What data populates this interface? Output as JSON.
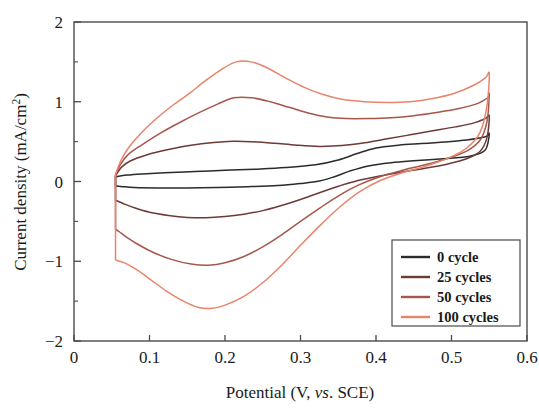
{
  "chart_data": {
    "type": "line",
    "title": "",
    "subtitle": "",
    "xlabel": "Potential (V, vs. SCE)",
    "xlabel_parts": {
      "before": "Potential (V, ",
      "italic": "vs",
      "after": ". SCE)"
    },
    "ylabel": "Current density (mA/cm2)",
    "ylabel_parts": {
      "main": "Current density (mA/cm",
      "superscript": "2",
      "tail": ")"
    },
    "xlim": [
      0,
      0.6
    ],
    "ylim": [
      -2,
      2
    ],
    "xticks": [
      0,
      0.1,
      0.2,
      0.3,
      0.4,
      0.5,
      0.6
    ],
    "xtick_labels": [
      "0",
      "0.1",
      "0.2",
      "0.3",
      "0.4",
      "0.5",
      "0.6"
    ],
    "yticks": [
      -2,
      -1,
      0,
      1,
      2
    ],
    "ytick_labels": [
      "-2",
      "-1",
      "0",
      "1",
      "2"
    ],
    "y_minor_ticks": [
      -1.5,
      -0.5,
      0.5,
      1.5
    ],
    "grid": false,
    "legend_position": "lower-right",
    "series": [
      {
        "name": "0 cycle",
        "color": "#2b2b2b",
        "forward": [
          [
            0.055,
            0.06
          ],
          [
            0.07,
            0.08
          ],
          [
            0.09,
            0.095
          ],
          [
            0.12,
            0.11
          ],
          [
            0.16,
            0.125
          ],
          [
            0.2,
            0.14
          ],
          [
            0.24,
            0.155
          ],
          [
            0.28,
            0.175
          ],
          [
            0.32,
            0.21
          ],
          [
            0.35,
            0.27
          ],
          [
            0.375,
            0.35
          ],
          [
            0.4,
            0.42
          ],
          [
            0.43,
            0.455
          ],
          [
            0.46,
            0.475
          ],
          [
            0.49,
            0.495
          ],
          [
            0.52,
            0.52
          ],
          [
            0.545,
            0.56
          ],
          [
            0.55,
            0.6
          ]
        ],
        "reverse": [
          [
            0.55,
            0.6
          ],
          [
            0.545,
            0.4
          ],
          [
            0.53,
            0.33
          ],
          [
            0.51,
            0.3
          ],
          [
            0.48,
            0.28
          ],
          [
            0.45,
            0.26
          ],
          [
            0.42,
            0.235
          ],
          [
            0.39,
            0.195
          ],
          [
            0.365,
            0.13
          ],
          [
            0.345,
            0.06
          ],
          [
            0.325,
            0.005
          ],
          [
            0.3,
            -0.025
          ],
          [
            0.27,
            -0.05
          ],
          [
            0.23,
            -0.065
          ],
          [
            0.19,
            -0.075
          ],
          [
            0.15,
            -0.08
          ],
          [
            0.11,
            -0.08
          ],
          [
            0.08,
            -0.075
          ],
          [
            0.065,
            -0.065
          ],
          [
            0.055,
            -0.055
          ]
        ]
      },
      {
        "name": "25 cycles",
        "color": "#6d3a36",
        "forward": [
          [
            0.055,
            0.07
          ],
          [
            0.063,
            0.18
          ],
          [
            0.075,
            0.26
          ],
          [
            0.095,
            0.33
          ],
          [
            0.125,
            0.4
          ],
          [
            0.155,
            0.455
          ],
          [
            0.185,
            0.49
          ],
          [
            0.21,
            0.505
          ],
          [
            0.235,
            0.5
          ],
          [
            0.265,
            0.48
          ],
          [
            0.295,
            0.455
          ],
          [
            0.325,
            0.44
          ],
          [
            0.355,
            0.45
          ],
          [
            0.385,
            0.485
          ],
          [
            0.415,
            0.535
          ],
          [
            0.445,
            0.585
          ],
          [
            0.475,
            0.635
          ],
          [
            0.505,
            0.685
          ],
          [
            0.53,
            0.735
          ],
          [
            0.545,
            0.79
          ],
          [
            0.55,
            0.82
          ]
        ],
        "reverse": [
          [
            0.55,
            0.82
          ],
          [
            0.547,
            0.55
          ],
          [
            0.538,
            0.38
          ],
          [
            0.52,
            0.285
          ],
          [
            0.495,
            0.22
          ],
          [
            0.465,
            0.165
          ],
          [
            0.435,
            0.12
          ],
          [
            0.405,
            0.07
          ],
          [
            0.375,
            0.01
          ],
          [
            0.35,
            -0.06
          ],
          [
            0.325,
            -0.14
          ],
          [
            0.3,
            -0.225
          ],
          [
            0.275,
            -0.3
          ],
          [
            0.25,
            -0.365
          ],
          [
            0.225,
            -0.41
          ],
          [
            0.2,
            -0.44
          ],
          [
            0.175,
            -0.455
          ],
          [
            0.15,
            -0.45
          ],
          [
            0.125,
            -0.425
          ],
          [
            0.1,
            -0.385
          ],
          [
            0.08,
            -0.33
          ],
          [
            0.065,
            -0.275
          ],
          [
            0.055,
            -0.235
          ]
        ]
      },
      {
        "name": "50 cycles",
        "color": "#a6564a",
        "forward": [
          [
            0.055,
            0.08
          ],
          [
            0.062,
            0.22
          ],
          [
            0.072,
            0.34
          ],
          [
            0.09,
            0.46
          ],
          [
            0.115,
            0.61
          ],
          [
            0.14,
            0.74
          ],
          [
            0.165,
            0.86
          ],
          [
            0.19,
            0.97
          ],
          [
            0.212,
            1.05
          ],
          [
            0.235,
            1.05
          ],
          [
            0.26,
            1.0
          ],
          [
            0.285,
            0.93
          ],
          [
            0.31,
            0.86
          ],
          [
            0.335,
            0.81
          ],
          [
            0.36,
            0.79
          ],
          [
            0.39,
            0.79
          ],
          [
            0.42,
            0.8
          ],
          [
            0.45,
            0.825
          ],
          [
            0.48,
            0.865
          ],
          [
            0.51,
            0.915
          ],
          [
            0.535,
            0.98
          ],
          [
            0.548,
            1.05
          ],
          [
            0.55,
            1.09
          ]
        ],
        "reverse": [
          [
            0.55,
            1.09
          ],
          [
            0.547,
            0.75
          ],
          [
            0.538,
            0.52
          ],
          [
            0.52,
            0.38
          ],
          [
            0.495,
            0.29
          ],
          [
            0.465,
            0.21
          ],
          [
            0.435,
            0.14
          ],
          [
            0.405,
            0.06
          ],
          [
            0.378,
            -0.04
          ],
          [
            0.352,
            -0.17
          ],
          [
            0.326,
            -0.33
          ],
          [
            0.3,
            -0.5
          ],
          [
            0.275,
            -0.67
          ],
          [
            0.25,
            -0.82
          ],
          [
            0.225,
            -0.94
          ],
          [
            0.2,
            -1.02
          ],
          [
            0.178,
            -1.05
          ],
          [
            0.155,
            -1.035
          ],
          [
            0.13,
            -0.98
          ],
          [
            0.105,
            -0.89
          ],
          [
            0.085,
            -0.79
          ],
          [
            0.07,
            -0.7
          ],
          [
            0.06,
            -0.63
          ],
          [
            0.055,
            -0.6
          ]
        ]
      },
      {
        "name": "100 cycles",
        "color": "#e8846c",
        "forward": [
          [
            0.055,
            0.09
          ],
          [
            0.062,
            0.26
          ],
          [
            0.072,
            0.42
          ],
          [
            0.088,
            0.6
          ],
          [
            0.108,
            0.78
          ],
          [
            0.13,
            0.95
          ],
          [
            0.152,
            1.1
          ],
          [
            0.175,
            1.27
          ],
          [
            0.196,
            1.41
          ],
          [
            0.215,
            1.5
          ],
          [
            0.235,
            1.5
          ],
          [
            0.255,
            1.43
          ],
          [
            0.28,
            1.3
          ],
          [
            0.305,
            1.18
          ],
          [
            0.33,
            1.09
          ],
          [
            0.355,
            1.03
          ],
          [
            0.385,
            1.0
          ],
          [
            0.415,
            0.99
          ],
          [
            0.445,
            1.0
          ],
          [
            0.475,
            1.04
          ],
          [
            0.505,
            1.11
          ],
          [
            0.53,
            1.21
          ],
          [
            0.545,
            1.3
          ],
          [
            0.55,
            1.35
          ]
        ],
        "reverse": [
          [
            0.55,
            1.35
          ],
          [
            0.547,
            0.95
          ],
          [
            0.538,
            0.62
          ],
          [
            0.52,
            0.42
          ],
          [
            0.495,
            0.29
          ],
          [
            0.465,
            0.19
          ],
          [
            0.435,
            0.11
          ],
          [
            0.405,
            0.01
          ],
          [
            0.378,
            -0.13
          ],
          [
            0.352,
            -0.32
          ],
          [
            0.326,
            -0.55
          ],
          [
            0.3,
            -0.8
          ],
          [
            0.275,
            -1.05
          ],
          [
            0.25,
            -1.27
          ],
          [
            0.225,
            -1.44
          ],
          [
            0.2,
            -1.55
          ],
          [
            0.183,
            -1.59
          ],
          [
            0.165,
            -1.58
          ],
          [
            0.145,
            -1.5
          ],
          [
            0.122,
            -1.37
          ],
          [
            0.1,
            -1.22
          ],
          [
            0.082,
            -1.1
          ],
          [
            0.067,
            -1.02
          ],
          [
            0.057,
            -0.99
          ],
          [
            0.055,
            -0.98
          ]
        ]
      }
    ],
    "legend": [
      {
        "label": "0 cycle",
        "color": "#2b2b2b"
      },
      {
        "label": "25 cycles",
        "color": "#6d3a36"
      },
      {
        "label": "50 cycles",
        "color": "#a6564a"
      },
      {
        "label": "100 cycles",
        "color": "#e8846c"
      }
    ]
  }
}
